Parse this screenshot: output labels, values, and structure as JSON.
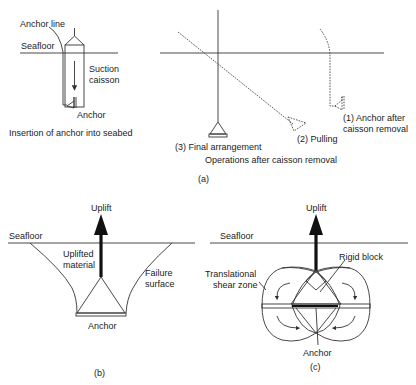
{
  "figure": {
    "panel_a": {
      "caption": "(a)",
      "insertion": {
        "anchor_line_label": "Anchor line",
        "seafloor_label": "Seafloor",
        "caisson_label_line1": "Suction",
        "caisson_label_line2": "caisson",
        "anchor_label": "Anchor",
        "title": "Insertion of anchor into seabed"
      },
      "operations": {
        "step1_line1": "(1) Anchor after",
        "step1_line2": "caisson removal",
        "step2": "(2) Pulling",
        "step3": "(3) Final arrangement",
        "title": "Operations after caisson removal"
      }
    },
    "panel_b": {
      "caption": "(b)",
      "uplift_label": "Uplift",
      "seafloor_label": "Seafloor",
      "material_line1": "Uplifted",
      "material_line2": "material",
      "failure_line1": "Failure",
      "failure_line2": "surface",
      "anchor_label": "Anchor"
    },
    "panel_c": {
      "caption": "(c)",
      "uplift_label": "Uplift",
      "seafloor_label": "Seafloor",
      "rigid_block_label": "Rigid block",
      "shear_line1": "Translational",
      "shear_line2": "shear zone",
      "anchor_label": "Anchor"
    }
  }
}
